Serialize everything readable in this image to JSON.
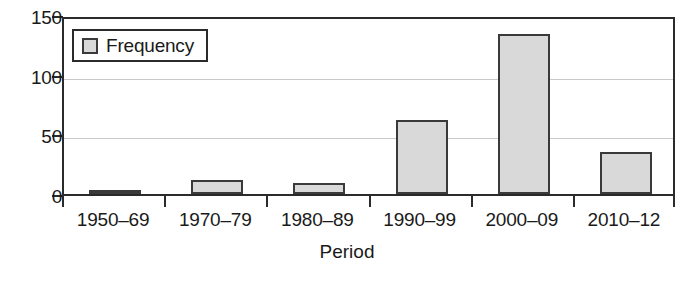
{
  "chart_data": {
    "type": "bar",
    "title": "",
    "subtitle": "",
    "xlabel": "Period",
    "ylabel": "",
    "categories": [
      "1950–69",
      "1970–79",
      "1980–89",
      "1990–99",
      "2000–09",
      "2010–12"
    ],
    "values": [
      3,
      12,
      9,
      62,
      134,
      35
    ],
    "series": [
      {
        "name": "Frequency",
        "values": [
          3,
          12,
          9,
          62,
          134,
          35
        ]
      }
    ],
    "ylim": [
      0,
      150
    ],
    "yticks": [
      0,
      50,
      100,
      150
    ],
    "ytick_labels": [
      "0",
      "50",
      "100",
      "150"
    ],
    "grid": true,
    "grid_axis": "y",
    "legend": {
      "position": "top-left",
      "entries": [
        {
          "label": "Frequency",
          "swatch": "legend-swatch-frequency"
        }
      ]
    },
    "colors": {
      "bar_fill": "#d9d9d9",
      "bar_border": "#3a3a3a",
      "axis": "#2b2b2b",
      "gridline": "#c9c9c9",
      "text": "#1a1a1a",
      "background": "#ffffff"
    }
  }
}
